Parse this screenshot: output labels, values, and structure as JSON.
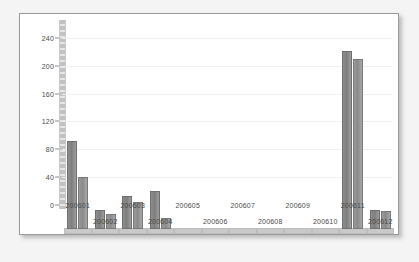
{
  "chart_data": {
    "type": "bar",
    "title": "",
    "subtitle": "",
    "xlabel": "",
    "ylabel": "",
    "grid": true,
    "legend_position": "none",
    "ylim": [
      0,
      260
    ],
    "yticks": [
      0,
      40,
      80,
      120,
      160,
      200,
      240
    ],
    "ytick_labels": [
      "0",
      "40",
      "80",
      "120",
      "160",
      "200",
      "240"
    ],
    "categories": [
      "200601",
      "200602",
      "200603",
      "200604",
      "200605",
      "200606",
      "200607",
      "200608",
      "200609",
      "200610",
      "200611",
      "200612"
    ],
    "series": [
      {
        "name": "series-1",
        "color": "#808080",
        "values": [
          119,
          20,
          40,
          47,
          0,
          0,
          0,
          0,
          0,
          0,
          248,
          20
        ]
      },
      {
        "name": "series-2",
        "color": "#949494",
        "values": [
          68,
          15,
          31,
          8,
          0,
          0,
          0,
          0,
          0,
          0,
          237,
          19
        ]
      }
    ]
  },
  "style": {
    "page_background": "#f4f4f4",
    "card_background": "#ffffff",
    "card_border": "#9a9a9a",
    "axis_color": "#8d8d8d",
    "gridline_color": "#f0f0f0",
    "tick_text_color": "#4a4a4a"
  }
}
